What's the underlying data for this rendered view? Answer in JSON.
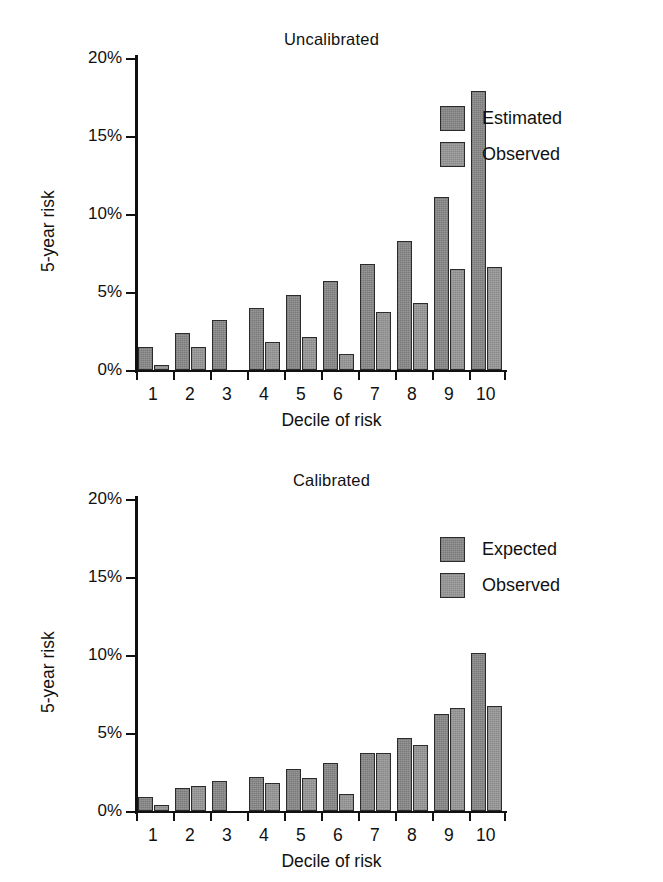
{
  "figure": {
    "panels": [
      {
        "id": "uncalibrated",
        "title": "Uncalibrated",
        "xlabel": "Decile of risk",
        "ylabel": "5-year risk",
        "legend": [
          {
            "label": "Estimated",
            "swatch": "series-0-swatch"
          },
          {
            "label": "Observed",
            "swatch": "series-1-swatch"
          }
        ],
        "yticks": [
          "0%",
          "5%",
          "10%",
          "15%",
          "20%"
        ],
        "xticks": [
          "1",
          "2",
          "3",
          "4",
          "5",
          "6",
          "7",
          "8",
          "9",
          "10"
        ]
      },
      {
        "id": "calibrated",
        "title": "Calibrated",
        "xlabel": "Decile of risk",
        "ylabel": "5-year risk",
        "legend": [
          {
            "label": "Expected",
            "swatch": "series-0-swatch"
          },
          {
            "label": "Observed",
            "swatch": "series-1-swatch"
          }
        ],
        "yticks": [
          "0%",
          "5%",
          "10%",
          "15%",
          "20%"
        ],
        "xticks": [
          "1",
          "2",
          "3",
          "4",
          "5",
          "6",
          "7",
          "8",
          "9",
          "10"
        ]
      }
    ],
    "colors": {
      "series_0": "#8c8c8c",
      "series_1": "#9a9a9a",
      "bar_outline": "#2b2b2b",
      "axis": "#111111",
      "background": "#ffffff"
    }
  },
  "chart_data": [
    {
      "type": "bar",
      "title": "Uncalibrated",
      "xlabel": "Decile of risk",
      "ylabel": "5-year risk",
      "categories": [
        "1",
        "2",
        "3",
        "4",
        "5",
        "6",
        "7",
        "8",
        "9",
        "10"
      ],
      "ylim": [
        0,
        20
      ],
      "yticks": [
        0,
        5,
        10,
        15,
        20
      ],
      "ytick_labels": [
        "0%",
        "5%",
        "10%",
        "15%",
        "20%"
      ],
      "grid": false,
      "legend_position": "upper right",
      "series": [
        {
          "name": "Estimated",
          "values": [
            1.5,
            2.4,
            3.2,
            4.0,
            4.8,
            5.7,
            6.8,
            8.3,
            11.1,
            17.9
          ]
        },
        {
          "name": "Observed",
          "values": [
            0.35,
            1.5,
            null,
            1.8,
            2.1,
            1.0,
            3.7,
            4.3,
            6.5,
            6.6
          ]
        }
      ]
    },
    {
      "type": "bar",
      "title": "Calibrated",
      "xlabel": "Decile of risk",
      "ylabel": "5-year risk",
      "categories": [
        "1",
        "2",
        "3",
        "4",
        "5",
        "6",
        "7",
        "8",
        "9",
        "10"
      ],
      "ylim": [
        0,
        20
      ],
      "yticks": [
        0,
        5,
        10,
        15,
        20
      ],
      "ytick_labels": [
        "0%",
        "5%",
        "10%",
        "15%",
        "20%"
      ],
      "grid": false,
      "legend_position": "upper right",
      "series": [
        {
          "name": "Expected",
          "values": [
            0.9,
            1.5,
            1.9,
            2.2,
            2.7,
            3.1,
            3.7,
            4.7,
            6.2,
            10.1
          ]
        },
        {
          "name": "Observed",
          "values": [
            0.4,
            1.6,
            null,
            1.8,
            2.1,
            1.1,
            3.7,
            4.2,
            6.6,
            6.7
          ]
        }
      ]
    }
  ]
}
